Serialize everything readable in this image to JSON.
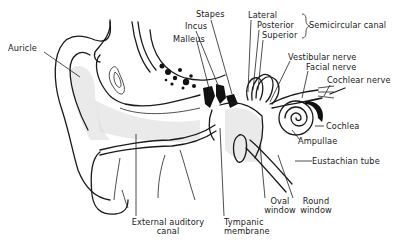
{
  "labels": {
    "auricle": "Auricle",
    "stapes": "Stapes",
    "incus": "Incus",
    "malleus": "Malleus",
    "lateral": "Lateral",
    "posterior": "Posterior",
    "superior": "Superior",
    "semicircular_canal": "Semicircular canal",
    "vestibular_nerve": "Vestibular nerve",
    "facial_nerve": "Facial nerve",
    "cochlear_nerve": "Cochlear nerve",
    "cochlea": "Cochlea",
    "ampullae": "Ampullae",
    "eustachian_tube": "Eustachian tube",
    "oval_window_1": "Oval",
    "oval_window_2": "window",
    "round_window_1": "Round",
    "round_window_2": "window",
    "external_canal_1": "External auditory",
    "external_canal_2": "canal",
    "tympanic_1": "Tympanic",
    "tympanic_2": "membrane"
  }
}
